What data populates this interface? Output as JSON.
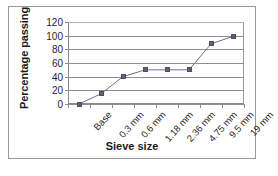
{
  "chart_data": {
    "type": "line",
    "title": "",
    "xlabel": "Sieve size",
    "ylabel": "Percentage passing",
    "categories": [
      "Base",
      "0.3 mm",
      "0.6 mm",
      "1.18 mm",
      "2.36 mm",
      "4.75 mm",
      "9.5 mm",
      "19 mm"
    ],
    "values": [
      0,
      15,
      40,
      50,
      50,
      50,
      88,
      99
    ],
    "series": [
      {
        "name": "Percentage passing",
        "values": [
          0,
          15,
          40,
          50,
          50,
          50,
          88,
          99
        ]
      }
    ],
    "ylim": [
      0,
      120
    ],
    "yticks": [
      0,
      20,
      40,
      60,
      80,
      100,
      120
    ],
    "ytick_labels": [
      "0",
      "20",
      "40",
      "60",
      "80",
      "100",
      "120"
    ],
    "grid": true,
    "grid_axis": "y",
    "legend": false,
    "marker": "square",
    "colors": {
      "series": "#5a6175",
      "gridline": "#8f8f8f",
      "top_gridline": "#a9b9a2",
      "axis": "#8a8a8a",
      "frame": "#9a9a9a",
      "text": "#1f1f1f",
      "background": "#ffffff"
    }
  }
}
